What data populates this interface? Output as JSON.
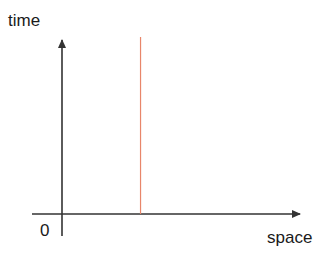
{
  "diagram": {
    "y_axis_label": "time",
    "x_axis_label": "space",
    "origin_label": "0",
    "colors": {
      "axis": "#333333",
      "worldline": "#e8866a"
    },
    "worldline": {
      "description": "vertical line at fixed position over time",
      "position_fraction_along_space_axis": 0.33
    }
  }
}
